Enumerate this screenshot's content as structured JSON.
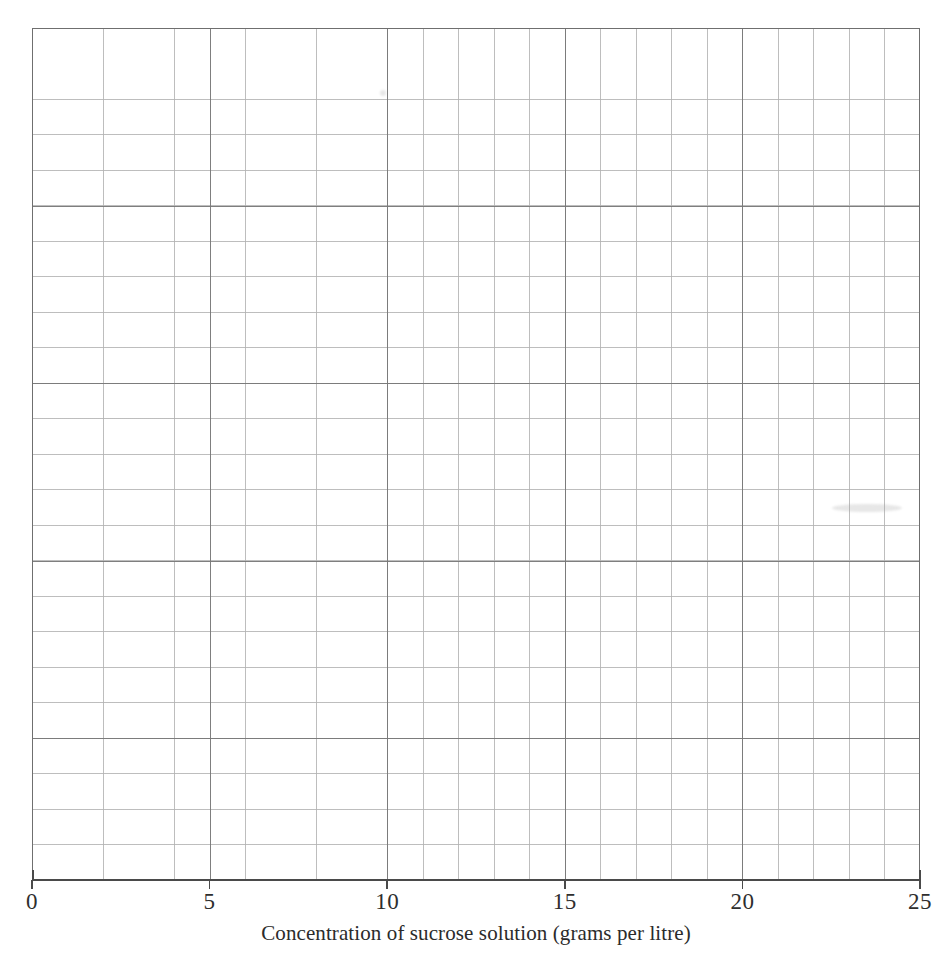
{
  "figure": {
    "background_color": "#ffffff",
    "plot": {
      "left": 32,
      "top": 28,
      "width": 888,
      "height": 852,
      "border_color": "#6f6f6f",
      "major_grid_color": "#787878",
      "minor_grid_color": "#b2b2b2",
      "minor_cells_x": 25,
      "minor_cells_y": 24,
      "major_every": 5
    }
  },
  "chart_data": {
    "type": "scatter",
    "title": "",
    "subtitle": "",
    "xlabel": "Concentration of sucrose solution (grams per litre)",
    "ylabel": "",
    "xlim": [
      0,
      25
    ],
    "xticks": [
      0,
      5,
      10,
      15,
      20,
      25
    ],
    "xtick_labels": [
      "0",
      "5",
      "10",
      "15",
      "20",
      "25"
    ],
    "yticks": [],
    "ytick_labels": [],
    "grid": true,
    "grid_minor": true,
    "legend": null,
    "legend_position": "none",
    "series": [],
    "annotations": [],
    "note": "Blank graph-paper grid for plotting: 25 minor columns by 24 minor rows, major gridlines every 5 minor cells, only the x-axis is labelled."
  },
  "axis": {
    "x": {
      "label": "Concentration of sucrose solution (grams per litre)",
      "ticks": [
        {
          "value": 0,
          "label": "0"
        },
        {
          "value": 5,
          "label": "5"
        },
        {
          "value": 10,
          "label": "10"
        },
        {
          "value": 15,
          "label": "15"
        },
        {
          "value": 20,
          "label": "20"
        },
        {
          "value": 25,
          "label": "25"
        }
      ],
      "line_color": "#4a4a4a",
      "label_color": "#2b2b2b"
    }
  }
}
